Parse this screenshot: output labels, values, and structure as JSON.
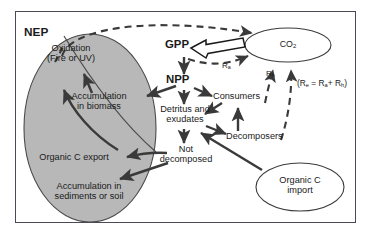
{
  "figure": {
    "border_color": "#4a4a55",
    "background": "#ffffff"
  },
  "pools": {
    "nep_region": {
      "label": "NEP",
      "fill": "#b8b8b8",
      "stroke": "#4a4a4a"
    },
    "co2": {
      "label_text": "CO",
      "label_sub": "2",
      "fill": "#ffffff",
      "stroke": "#3c3c3c"
    },
    "organic_c_import": {
      "line1": "Organic C",
      "line2": "import",
      "fill": "#ffffff",
      "stroke": "#3c3c3c"
    }
  },
  "nodes": {
    "oxidation": {
      "line1": "Oxidation",
      "line2": "(Fire or UV)"
    },
    "accumulation_biomass": {
      "line1": "Accumulation",
      "line2": "in biomass"
    },
    "organic_c_export": {
      "line1": "Organic C export"
    },
    "accumulation_sediments": {
      "line1": "Accumulation in",
      "line2": "sediments or soil"
    },
    "gpp": {
      "label": "GPP"
    },
    "npp": {
      "label": "NPP"
    },
    "detritus": {
      "line1": "Detritus and",
      "line2": "exudates"
    },
    "not_decomposed": {
      "line1": "Not",
      "line2": "decomposed"
    },
    "consumers": {
      "label": "Consumers"
    },
    "decomposers": {
      "label": "Decomposers"
    }
  },
  "flux_labels": {
    "ra": {
      "symbol": "R",
      "subscript": "a"
    },
    "rh": {
      "symbol": "R",
      "subscript": "h"
    },
    "equation": {
      "open": "(R",
      "sub_e": "e",
      "equals": " = R",
      "sub_a": "a",
      "plus": "+ R",
      "sub_h": "h",
      "close": ")"
    }
  },
  "colors": {
    "arrow_solid": "#3a3a3a",
    "arrow_dashed": "#3a3a3a",
    "ellipse_gray": "#b8b8b8",
    "text": "#1a1a1a"
  }
}
